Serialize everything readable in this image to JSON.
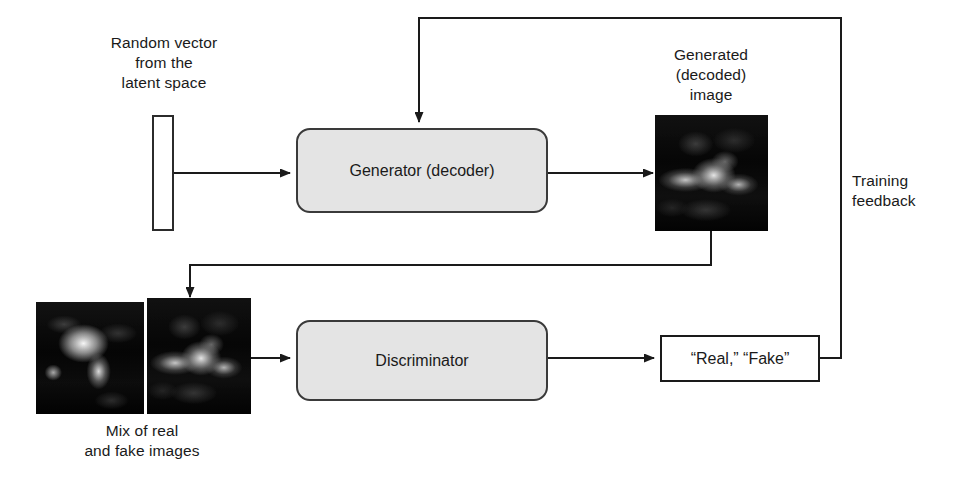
{
  "diagram": {
    "colors": {
      "box_fill": "#e4e4e4",
      "box_border": "#3a3a3a",
      "line": "#1a1a1a",
      "text": "#1a1a1a",
      "background": "#ffffff"
    },
    "labels": {
      "latent_vector": "Random vector\nfrom the\nlatent space",
      "generated_image": "Generated\n(decoded)\nimage",
      "mix_images": "Mix of real\nand fake images",
      "training_feedback": "Training\nfeedback"
    },
    "nodes": {
      "generator": "Generator (decoder)",
      "discriminator": "Discriminator",
      "verdict": "“Real,” “Fake”"
    },
    "thumbnails": {
      "generated": "generated-image-thumbnail",
      "real": "real-image-thumbnail",
      "fake": "fake-image-thumbnail"
    },
    "icons": {
      "latent_vector_shape": "vertical-bar-icon",
      "arrow": "arrow-head-icon"
    }
  }
}
